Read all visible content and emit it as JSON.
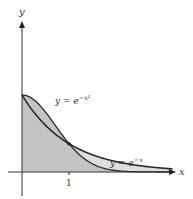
{
  "figure": {
    "axes": {
      "x_label": "x",
      "y_label": "y",
      "x_tick_label": "1"
    },
    "curves": [
      {
        "id": "gauss",
        "label_prefix": "y = e",
        "label_exponent": "−x²",
        "expr": "e^{-x^2}"
      },
      {
        "id": "exp",
        "label_prefix": "y = e",
        "label_exponent": "−x",
        "expr": "e^{-x}"
      }
    ],
    "colors": {
      "axis": "#333333",
      "curve": "#2b2b2b",
      "fill_main": "#c4c4c4",
      "fill_between": "#dedede"
    }
  },
  "chart_data": {
    "type": "area",
    "title": "",
    "xlabel": "x",
    "ylabel": "y",
    "x_ticks": [
      "1"
    ],
    "series": [
      {
        "name": "y = e^{-x^2}",
        "x": [
          0,
          0.25,
          0.5,
          0.75,
          1,
          1.5,
          2,
          2.5,
          3
        ],
        "values": [
          1,
          0.939,
          0.779,
          0.57,
          0.368,
          0.105,
          0.018,
          0.002,
          0.0001
        ]
      },
      {
        "name": "y = e^{-x}",
        "x": [
          0,
          0.25,
          0.5,
          0.75,
          1,
          1.5,
          2,
          2.5,
          3
        ],
        "values": [
          1,
          0.779,
          0.607,
          0.472,
          0.368,
          0.223,
          0.135,
          0.082,
          0.05
        ]
      }
    ],
    "annotations": [
      "Curves intersect at x = 1",
      "Shaded area under both curves"
    ],
    "xlim": [
      0,
      3.3
    ],
    "ylim": [
      0,
      2
    ]
  }
}
